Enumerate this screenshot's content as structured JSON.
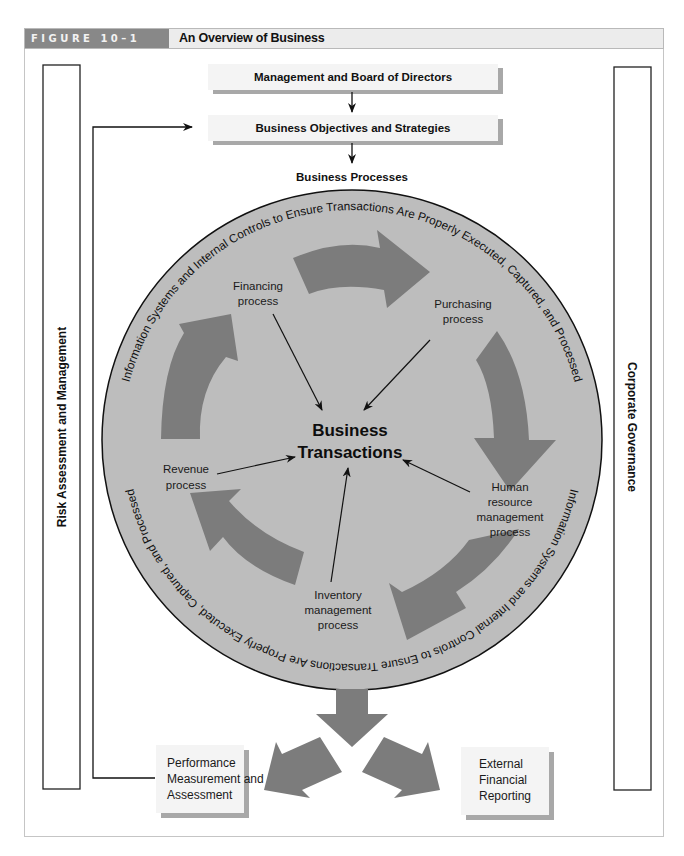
{
  "figure": {
    "tag": "FIGURE 10–1",
    "title": "An Overview of Business"
  },
  "side_panels": {
    "left": "Risk Assessment and Management",
    "right": "Corporate Governance"
  },
  "top_boxes": {
    "management": "Management and Board of Directors",
    "objectives": "Business Objectives and Strategies"
  },
  "business_processes_label": "Business Processes",
  "ring_text": {
    "top": "Information Systems and Internal Controls to Ensure Transactions Are Properly Executed, Captured, and Processed",
    "bottom": "Information Systems and Internal Controls to Ensure Transactions Are Properly Executed, Captured, and Processed"
  },
  "center": {
    "line1": "Business",
    "line2": "Transactions"
  },
  "processes": [
    {
      "id": "financing",
      "lines": [
        "Financing",
        "process"
      ]
    },
    {
      "id": "purchasing",
      "lines": [
        "Purchasing",
        "process"
      ]
    },
    {
      "id": "human-resource",
      "lines": [
        "Human",
        "resource",
        "management",
        "process"
      ]
    },
    {
      "id": "inventory",
      "lines": [
        "Inventory",
        "management",
        "process"
      ]
    },
    {
      "id": "revenue",
      "lines": [
        "Revenue",
        "process"
      ]
    }
  ],
  "outputs": {
    "performance": [
      "Performance",
      "Measurement and",
      "Assessment"
    ],
    "external": [
      "External",
      "Financial",
      "Reporting"
    ]
  },
  "colors": {
    "header_tag_bg": "#888888",
    "header_bg": "#ececec",
    "circle_fill": "#bdbdbd",
    "arrow_fill": "#7c7c7c",
    "box_fill": "#f3f3f3",
    "box_shadow": "#a8a8a8"
  }
}
